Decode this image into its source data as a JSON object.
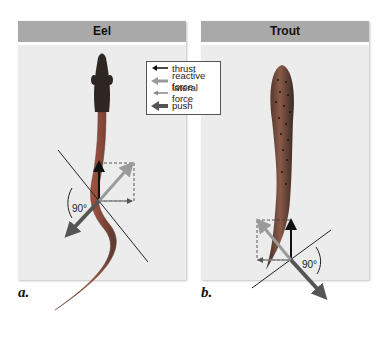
{
  "panels": [
    {
      "id": "a",
      "title": "Eel",
      "label": "a.",
      "angle": "90°"
    },
    {
      "id": "b",
      "title": "Trout",
      "label": "b.",
      "angle": "90°"
    }
  ],
  "legend": {
    "items": [
      {
        "name": "thrust",
        "label": "thrust",
        "color": "#111111"
      },
      {
        "name": "reactive-force",
        "label": "reactive force",
        "color": "#9a9a9a"
      },
      {
        "name": "lateral-force",
        "label": "lateral force",
        "color": "#8a8a8a"
      },
      {
        "name": "push",
        "label": "push",
        "color": "#555555"
      }
    ]
  },
  "colors": {
    "header": "#a9a9a9",
    "panel_bg": "#ececec",
    "eel_body": "#b0503a",
    "eel_head": "#2e2622",
    "trout_body": "#7a4a3a"
  }
}
